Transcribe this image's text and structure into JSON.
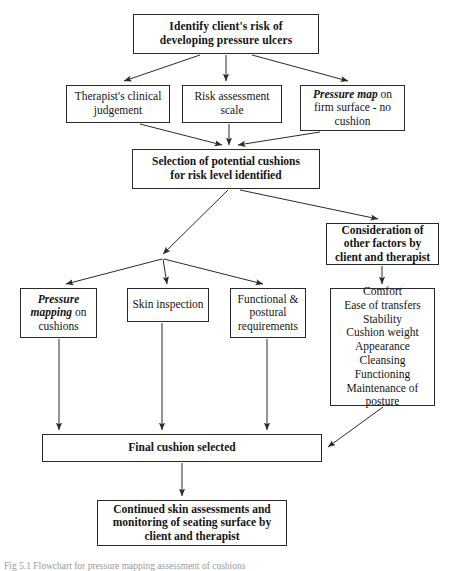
{
  "figure": {
    "type": "flowchart",
    "caption": "Fig 5.1 Flowchart for pressure mapping assessment of cushions",
    "background_color": "#ffffff",
    "line_color": "#2b2b2b"
  },
  "nodes": {
    "identify": {
      "id": "identify-client-risk",
      "line1": "Identify client's risk of",
      "line2": "developing pressure ulcers",
      "style": "bold"
    },
    "therapist": {
      "id": "therapists-clinical-judgement",
      "line1": "Therapist's clinical",
      "line2": "judgement",
      "style": "plain"
    },
    "risk_scale": {
      "id": "risk-assessment-scale",
      "line1": "Risk assessment",
      "line2": "scale",
      "style": "plain"
    },
    "pressure_map": {
      "id": "pressure-map-firm-surface",
      "emphasis": "Pressure map",
      "line1_rest": " on",
      "line2": "firm surface - no",
      "line3": "cushion",
      "style": "plain"
    },
    "selection": {
      "id": "selection-of-potential-cushions",
      "line1": "Selection of potential cushions",
      "line2": "for risk level identified",
      "style": "bold"
    },
    "consideration": {
      "id": "consideration-of-other-factors",
      "line1": "Consideration of",
      "line2": "other factors by",
      "line3": "client and therapist",
      "style": "bold"
    },
    "mapping": {
      "id": "pressure-mapping-on-cushions",
      "emphasis1": "Pressure",
      "emphasis2": "mapping",
      "line2_rest": " on",
      "line3": "cushions",
      "style": "plain"
    },
    "skin": {
      "id": "skin-inspection",
      "line1": "Skin inspection",
      "style": "plain"
    },
    "functional": {
      "id": "functional-postural-requirements",
      "line1": "Functional &",
      "line2": "postural",
      "line3": "requirements",
      "style": "plain"
    },
    "factors": {
      "id": "other-factors-list",
      "items": [
        "Comfort",
        "Ease of transfers",
        "Stability",
        "Cushion weight",
        "Appearance",
        "Cleansing",
        "Functioning",
        "Maintenance of",
        "posture"
      ],
      "style": "plain"
    },
    "final": {
      "id": "final-cushion-selected",
      "line1": "Final cushion selected",
      "style": "bold"
    },
    "continued": {
      "id": "continued-skin-assessments",
      "line1": "Continued skin assessments and",
      "line2": "monitoring of seating surface by",
      "line3": "client and therapist",
      "style": "bold"
    }
  },
  "edges": [
    {
      "from": "identify",
      "to": "therapist",
      "kind": "arrow"
    },
    {
      "from": "identify",
      "to": "risk_scale",
      "kind": "arrow"
    },
    {
      "from": "identify",
      "to": "pressure_map",
      "kind": "arrow"
    },
    {
      "from": "therapist",
      "to": "selection",
      "kind": "arrow"
    },
    {
      "from": "risk_scale",
      "to": "selection",
      "kind": "arrow"
    },
    {
      "from": "pressure_map",
      "to": "selection",
      "kind": "arrow"
    },
    {
      "from": "selection",
      "to": "consideration",
      "kind": "arrow"
    },
    {
      "from": "selection",
      "to": "branch-junction",
      "kind": "arrow"
    },
    {
      "from": "branch-junction",
      "to": "mapping",
      "kind": "arrow"
    },
    {
      "from": "branch-junction",
      "to": "skin",
      "kind": "arrow"
    },
    {
      "from": "branch-junction",
      "to": "functional",
      "kind": "arrow"
    },
    {
      "from": "consideration",
      "to": "factors",
      "kind": "arrow"
    },
    {
      "from": "mapping",
      "to": "final",
      "kind": "arrow"
    },
    {
      "from": "skin",
      "to": "final",
      "kind": "arrow"
    },
    {
      "from": "functional",
      "to": "final",
      "kind": "arrow"
    },
    {
      "from": "factors",
      "to": "final",
      "kind": "arrow"
    },
    {
      "from": "final",
      "to": "continued",
      "kind": "arrow"
    }
  ]
}
